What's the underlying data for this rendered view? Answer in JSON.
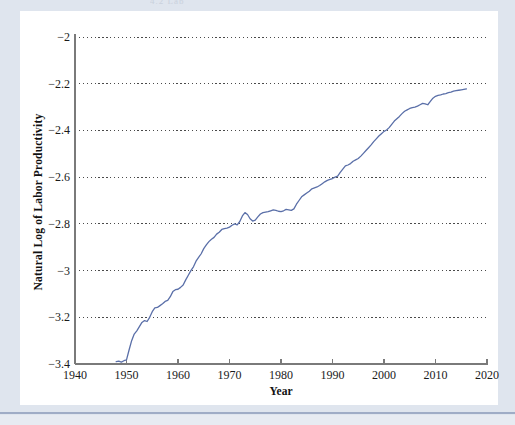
{
  "scan": {
    "header_fragment": "4.2   Lab",
    "background_color": "#dfe5ee",
    "card_color": "#ffffff"
  },
  "chart_data": {
    "type": "line",
    "title": "",
    "subtitle": "",
    "xlabel": "Year",
    "ylabel": "Natural Log of Labor Productivity",
    "xlim": [
      1940,
      2020
    ],
    "ylim": [
      -3.4,
      -2.0
    ],
    "xticks": [
      1940,
      1950,
      1960,
      1970,
      1980,
      1990,
      2000,
      2010,
      2020
    ],
    "xtick_labels": [
      "1940",
      "1950",
      "1960",
      "1970",
      "1980",
      "1990",
      "2000",
      "2010",
      "2020"
    ],
    "yticks": [
      -2.0,
      -2.2,
      -2.4,
      -2.6,
      -2.8,
      -3.0,
      -3.2,
      -3.4
    ],
    "ytick_labels": [
      "−2",
      "−2.2",
      "−2.4",
      "−2.6",
      "−2.8",
      "−3",
      "−3.2",
      "−3.4"
    ],
    "grid": "horizontal-dotted",
    "grid_color": "#4a4a4a",
    "legend": "none",
    "line_color": "#5a6fa8",
    "line_width": 1.3,
    "series": [
      {
        "name": "Natural Log of Labor Productivity",
        "x": [
          1948.0,
          1948.5,
          1949.0,
          1949.5,
          1950.0,
          1950.5,
          1951.0,
          1951.5,
          1952.0,
          1952.5,
          1953.0,
          1953.5,
          1954.0,
          1954.5,
          1955.0,
          1955.5,
          1956.0,
          1956.5,
          1957.0,
          1957.5,
          1958.0,
          1958.5,
          1959.0,
          1959.5,
          1960.0,
          1960.5,
          1961.0,
          1961.5,
          1962.0,
          1962.5,
          1963.0,
          1963.5,
          1964.0,
          1964.5,
          1965.0,
          1965.5,
          1966.0,
          1966.5,
          1967.0,
          1967.5,
          1968.0,
          1968.5,
          1969.0,
          1969.5,
          1970.0,
          1970.5,
          1971.0,
          1971.5,
          1972.0,
          1972.5,
          1973.0,
          1973.5,
          1974.0,
          1974.5,
          1975.0,
          1975.5,
          1976.0,
          1976.5,
          1977.0,
          1977.5,
          1978.0,
          1978.5,
          1979.0,
          1979.5,
          1980.0,
          1980.5,
          1981.0,
          1981.5,
          1982.0,
          1982.5,
          1983.0,
          1983.5,
          1984.0,
          1984.5,
          1985.0,
          1985.5,
          1986.0,
          1986.5,
          1987.0,
          1987.5,
          1988.0,
          1988.5,
          1989.0,
          1989.5,
          1990.0,
          1990.5,
          1991.0,
          1991.5,
          1992.0,
          1992.5,
          1993.0,
          1993.5,
          1994.0,
          1994.5,
          1995.0,
          1995.5,
          1996.0,
          1996.5,
          1997.0,
          1997.5,
          1998.0,
          1998.5,
          1999.0,
          1999.5,
          2000.0,
          2000.5,
          2001.0,
          2001.5,
          2002.0,
          2002.5,
          2003.0,
          2003.5,
          2004.0,
          2004.5,
          2005.0,
          2005.5,
          2006.0,
          2006.5,
          2007.0,
          2007.5,
          2008.0,
          2008.5,
          2009.0,
          2009.5,
          2010.0,
          2010.5,
          2011.0,
          2011.5,
          2012.0,
          2012.5,
          2013.0,
          2013.5,
          2014.0,
          2014.5,
          2015.0,
          2015.5,
          2016.0
        ],
        "y": [
          -3.39,
          -3.388,
          -3.392,
          -3.386,
          -3.382,
          -3.34,
          -3.3,
          -3.272,
          -3.258,
          -3.24,
          -3.222,
          -3.214,
          -3.218,
          -3.2,
          -3.176,
          -3.16,
          -3.158,
          -3.15,
          -3.142,
          -3.132,
          -3.128,
          -3.112,
          -3.09,
          -3.082,
          -3.08,
          -3.072,
          -3.062,
          -3.04,
          -3.02,
          -3.0,
          -2.984,
          -2.96,
          -2.944,
          -2.928,
          -2.906,
          -2.89,
          -2.876,
          -2.866,
          -2.858,
          -2.844,
          -2.836,
          -2.824,
          -2.82,
          -2.818,
          -2.814,
          -2.806,
          -2.8,
          -2.804,
          -2.79,
          -2.766,
          -2.752,
          -2.76,
          -2.778,
          -2.788,
          -2.784,
          -2.77,
          -2.758,
          -2.752,
          -2.75,
          -2.748,
          -2.744,
          -2.74,
          -2.742,
          -2.746,
          -2.748,
          -2.744,
          -2.738,
          -2.74,
          -2.742,
          -2.736,
          -2.716,
          -2.7,
          -2.684,
          -2.676,
          -2.668,
          -2.66,
          -2.65,
          -2.646,
          -2.642,
          -2.636,
          -2.628,
          -2.62,
          -2.614,
          -2.61,
          -2.606,
          -2.6,
          -2.596,
          -2.58,
          -2.566,
          -2.552,
          -2.548,
          -2.542,
          -2.532,
          -2.526,
          -2.52,
          -2.51,
          -2.498,
          -2.486,
          -2.474,
          -2.462,
          -2.448,
          -2.436,
          -2.424,
          -2.414,
          -2.404,
          -2.398,
          -2.388,
          -2.374,
          -2.36,
          -2.35,
          -2.34,
          -2.328,
          -2.318,
          -2.312,
          -2.306,
          -2.302,
          -2.3,
          -2.296,
          -2.29,
          -2.284,
          -2.286,
          -2.29,
          -2.276,
          -2.262,
          -2.254,
          -2.25,
          -2.248,
          -2.244,
          -2.242,
          -2.238,
          -2.236,
          -2.232,
          -2.23,
          -2.228,
          -2.226,
          -2.224,
          -2.222
        ]
      }
    ]
  }
}
